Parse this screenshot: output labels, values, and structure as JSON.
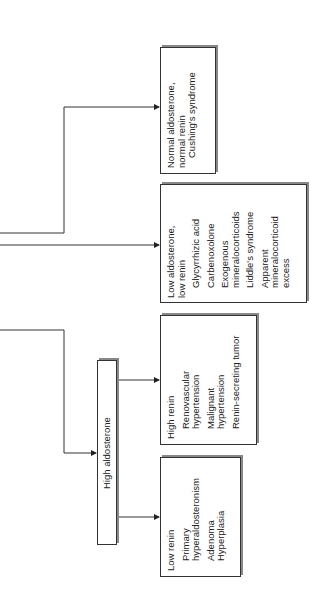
{
  "diagram": {
    "orientation": "rotated-90-ccw",
    "nodes": {
      "high_aldosterone": {
        "label": "High aldosterone"
      },
      "normal_aldo": {
        "heading": [
          "Normal aldosterone,",
          "normal renin"
        ],
        "items": [
          "Cushing's syndrome"
        ]
      },
      "low_aldo": {
        "heading": [
          "Low aldosterone,",
          "low renin"
        ],
        "items": [
          "Glycyrrhizic acid",
          "Carbenoxolone",
          "Exogenous",
          "mineralocorticoids",
          "Liddle's syndrome",
          "Apparent",
          "mineralocorticoid",
          "excess"
        ]
      },
      "high_renin": {
        "heading": [
          "High renin"
        ],
        "items": [
          "Renovascular",
          "hypertension",
          "Malignant",
          "hypertension",
          "Renin-secreting tumor"
        ]
      },
      "low_renin": {
        "heading": [
          "Low renin"
        ],
        "items": [
          "Primary",
          "hyperaldosteronism",
          "Adenoma",
          "Hyperplasia"
        ]
      }
    }
  }
}
